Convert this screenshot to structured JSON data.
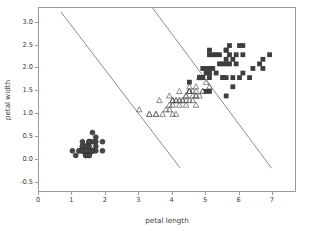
{
  "chart_data": {
    "type": "scatter",
    "title": "",
    "xlabel": "petal length",
    "ylabel": "petal width",
    "xlim": [
      0,
      7.72
    ],
    "ylim": [
      -0.72,
      3.32
    ],
    "xticks": [
      0,
      1,
      2,
      3,
      4,
      5,
      6,
      7
    ],
    "xtick_labels": [
      "0",
      "1",
      "2",
      "3",
      "4",
      "5",
      "6",
      "7"
    ],
    "yticks": [
      -0.5,
      0.0,
      0.5,
      1.0,
      1.5,
      2.0,
      2.5,
      3.0
    ],
    "ytick_labels": [
      "-0.5",
      "0.0",
      "0.5",
      "1.0",
      "1.5",
      "2.0",
      "2.5",
      "3.0"
    ],
    "grid": false,
    "legend": "none",
    "series": [
      {
        "name": "setosa",
        "marker": "circle",
        "filled": true,
        "color": "#474747",
        "points": [
          [
            1.4,
            0.2
          ],
          [
            1.4,
            0.2
          ],
          [
            1.3,
            0.2
          ],
          [
            1.5,
            0.2
          ],
          [
            1.4,
            0.2
          ],
          [
            1.7,
            0.4
          ],
          [
            1.4,
            0.3
          ],
          [
            1.5,
            0.2
          ],
          [
            1.4,
            0.2
          ],
          [
            1.5,
            0.1
          ],
          [
            1.5,
            0.2
          ],
          [
            1.6,
            0.2
          ],
          [
            1.4,
            0.1
          ],
          [
            1.1,
            0.1
          ],
          [
            1.2,
            0.2
          ],
          [
            1.5,
            0.4
          ],
          [
            1.3,
            0.4
          ],
          [
            1.4,
            0.3
          ],
          [
            1.7,
            0.3
          ],
          [
            1.5,
            0.3
          ],
          [
            1.7,
            0.2
          ],
          [
            1.5,
            0.4
          ],
          [
            1.0,
            0.2
          ],
          [
            1.7,
            0.5
          ],
          [
            1.9,
            0.2
          ],
          [
            1.6,
            0.2
          ],
          [
            1.6,
            0.4
          ],
          [
            1.5,
            0.2
          ],
          [
            1.4,
            0.2
          ],
          [
            1.6,
            0.2
          ],
          [
            1.6,
            0.2
          ],
          [
            1.5,
            0.4
          ],
          [
            1.5,
            0.1
          ],
          [
            1.4,
            0.2
          ],
          [
            1.5,
            0.2
          ],
          [
            1.2,
            0.2
          ],
          [
            1.3,
            0.2
          ],
          [
            1.4,
            0.1
          ],
          [
            1.3,
            0.2
          ],
          [
            1.5,
            0.2
          ],
          [
            1.3,
            0.3
          ],
          [
            1.3,
            0.3
          ],
          [
            1.3,
            0.2
          ],
          [
            1.6,
            0.6
          ],
          [
            1.9,
            0.4
          ],
          [
            1.4,
            0.3
          ],
          [
            1.6,
            0.2
          ],
          [
            1.4,
            0.2
          ],
          [
            1.5,
            0.2
          ],
          [
            1.4,
            0.2
          ]
        ]
      },
      {
        "name": "versicolor",
        "marker": "triangle",
        "filled": false,
        "color": "#5a5a5a",
        "points": [
          [
            4.7,
            1.4
          ],
          [
            4.5,
            1.5
          ],
          [
            4.9,
            1.5
          ],
          [
            4.0,
            1.3
          ],
          [
            4.6,
            1.5
          ],
          [
            4.5,
            1.3
          ],
          [
            4.7,
            1.6
          ],
          [
            3.3,
            1.0
          ],
          [
            4.6,
            1.3
          ],
          [
            3.9,
            1.4
          ],
          [
            3.5,
            1.0
          ],
          [
            4.2,
            1.5
          ],
          [
            4.0,
            1.0
          ],
          [
            4.7,
            1.4
          ],
          [
            3.6,
            1.3
          ],
          [
            4.4,
            1.4
          ],
          [
            4.5,
            1.5
          ],
          [
            4.1,
            1.0
          ],
          [
            4.5,
            1.5
          ],
          [
            3.9,
            1.1
          ],
          [
            4.8,
            1.8
          ],
          [
            4.0,
            1.3
          ],
          [
            4.9,
            1.5
          ],
          [
            4.7,
            1.2
          ],
          [
            4.3,
            1.3
          ],
          [
            4.4,
            1.4
          ],
          [
            4.8,
            1.4
          ],
          [
            5.0,
            1.7
          ],
          [
            4.5,
            1.5
          ],
          [
            3.5,
            1.0
          ],
          [
            3.8,
            1.1
          ],
          [
            3.7,
            1.0
          ],
          [
            3.9,
            1.2
          ],
          [
            5.1,
            1.6
          ],
          [
            4.5,
            1.5
          ],
          [
            4.5,
            1.6
          ],
          [
            4.7,
            1.5
          ],
          [
            4.4,
            1.3
          ],
          [
            4.1,
            1.3
          ],
          [
            4.0,
            1.3
          ],
          [
            4.4,
            1.2
          ],
          [
            4.6,
            1.4
          ],
          [
            4.0,
            1.2
          ],
          [
            3.3,
            1.0
          ],
          [
            4.2,
            1.3
          ],
          [
            4.2,
            1.2
          ],
          [
            4.2,
            1.3
          ],
          [
            4.3,
            1.3
          ],
          [
            3.0,
            1.1
          ],
          [
            4.1,
            1.3
          ]
        ]
      },
      {
        "name": "virginica",
        "marker": "square",
        "filled": true,
        "color": "#3d3d3d",
        "points": [
          [
            6.0,
            2.5
          ],
          [
            5.1,
            1.9
          ],
          [
            5.9,
            2.1
          ],
          [
            5.6,
            1.8
          ],
          [
            5.8,
            2.2
          ],
          [
            6.6,
            2.1
          ],
          [
            4.5,
            1.7
          ],
          [
            6.3,
            1.8
          ],
          [
            5.8,
            1.8
          ],
          [
            6.1,
            2.5
          ],
          [
            5.1,
            2.0
          ],
          [
            5.3,
            1.9
          ],
          [
            5.5,
            2.1
          ],
          [
            5.0,
            2.0
          ],
          [
            5.1,
            2.4
          ],
          [
            5.3,
            2.3
          ],
          [
            5.5,
            1.8
          ],
          [
            6.7,
            2.2
          ],
          [
            6.9,
            2.3
          ],
          [
            5.0,
            1.5
          ],
          [
            5.7,
            2.3
          ],
          [
            4.9,
            2.0
          ],
          [
            6.7,
            2.0
          ],
          [
            4.9,
            1.8
          ],
          [
            5.7,
            2.1
          ],
          [
            6.0,
            1.8
          ],
          [
            4.8,
            1.8
          ],
          [
            4.9,
            1.8
          ],
          [
            5.6,
            2.1
          ],
          [
            5.8,
            1.6
          ],
          [
            6.1,
            1.9
          ],
          [
            6.4,
            2.0
          ],
          [
            5.6,
            2.2
          ],
          [
            5.1,
            1.5
          ],
          [
            5.6,
            1.4
          ],
          [
            6.1,
            2.3
          ],
          [
            5.6,
            2.4
          ],
          [
            5.5,
            1.8
          ],
          [
            4.8,
            1.8
          ],
          [
            5.4,
            2.1
          ],
          [
            5.6,
            2.4
          ],
          [
            5.1,
            2.3
          ],
          [
            5.1,
            1.9
          ],
          [
            5.9,
            2.3
          ],
          [
            5.7,
            2.5
          ],
          [
            5.2,
            2.3
          ],
          [
            5.0,
            1.9
          ],
          [
            5.2,
            2.0
          ],
          [
            5.4,
            2.3
          ],
          [
            5.1,
            1.8
          ]
        ]
      }
    ],
    "boundary_lines": [
      {
        "name": "setosa-versicolor-boundary",
        "color": "#5a5a5a",
        "x": [
          0.66,
          4.22
        ],
        "y": [
          3.23,
          -0.17
        ]
      },
      {
        "name": "versicolor-virginica-boundary",
        "color": "#5a5a5a",
        "x": [
          3.4,
          6.96
        ],
        "y": [
          3.32,
          -0.18
        ]
      }
    ]
  }
}
